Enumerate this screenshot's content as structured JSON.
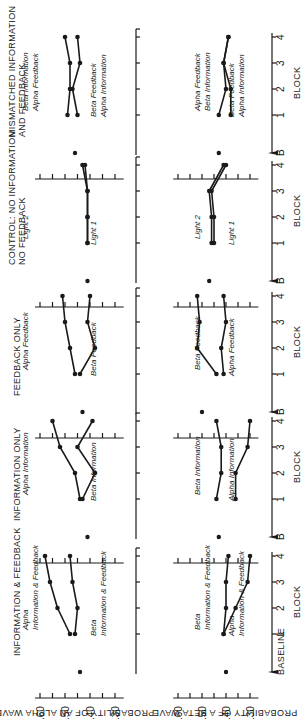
{
  "chart_data": {
    "type": "line",
    "orientation": "figure rotated 90° counterclockwise",
    "ylabel_alpha": "PROBABILITY OF AN ALPHA WAVE",
    "ylabel_beta": "PROBABILITY OF A BETA WAVE",
    "xlabel": "BLOCK",
    "x_ticks": [
      "B",
      "1",
      "2",
      "3",
      "4"
    ],
    "x_first_label": "BASELINE",
    "y_ticks": [
      ".60",
      ".50",
      ".40",
      ".30"
    ],
    "ylim": [
      0.25,
      0.62
    ],
    "panels": [
      {
        "title": "INFORMATION & FEEDBACK",
        "alpha": {
          "baseline": 0.44,
          "series": [
            {
              "name": "Alpha Information & Feedback",
              "values": [
                0.48,
                0.53,
                0.56,
                0.58
              ]
            },
            {
              "name": "Beta Information & Feedback",
              "values": [
                0.46,
                0.45,
                0.47,
                0.48
              ]
            }
          ]
        },
        "beta": {
          "baseline": 0.4,
          "series": [
            {
              "name": "Beta Information & Feedback",
              "values": [
                0.41,
                0.4,
                0.4,
                0.39
              ]
            },
            {
              "name": "Alpha Information & Feedback",
              "values": [
                0.41,
                0.36,
                0.31,
                0.3
              ]
            }
          ]
        }
      },
      {
        "title": "INFORMATION ONLY",
        "alpha": {
          "baseline": 0.41,
          "series": [
            {
              "name": "Alpha Information",
              "values": [
                0.44,
                0.46,
                0.52,
                0.55
              ]
            },
            {
              "name": "Beta Information",
              "values": [
                0.43,
                0.38,
                0.45,
                0.39
              ]
            }
          ]
        },
        "beta": {
          "baseline": 0.43,
          "series": [
            {
              "name": "Beta Information",
              "values": [
                0.44,
                0.42,
                0.42,
                0.44
              ]
            },
            {
              "name": "Alpha Information",
              "values": [
                0.36,
                0.36,
                0.31,
                0.3
              ]
            }
          ]
        }
      },
      {
        "title": "FEEDBACK ONLY",
        "alpha": {
          "baseline": 0.43,
          "series": [
            {
              "name": "Alpha Feedback",
              "values": [
                0.46,
                0.48,
                0.5,
                0.51
              ]
            },
            {
              "name": "Beta Feedback",
              "values": [
                0.44,
                0.38,
                0.41,
                0.4
              ]
            }
          ]
        },
        "beta": {
          "baseline": 0.5,
          "series": [
            {
              "name": "Beta Feedback",
              "values": [
                0.44,
                0.52,
                0.51,
                0.52
              ]
            },
            {
              "name": "Alpha Feedback",
              "values": [
                0.41,
                0.42,
                0.4,
                0.41
              ]
            }
          ]
        }
      },
      {
        "title": "CONTROL: NO INFORMATION NO FEEDBACK",
        "alpha": {
          "baseline": 0.41,
          "series": [
            {
              "name": "Light 2",
              "values": [
                0.41,
                0.41,
                0.41,
                0.43
              ]
            },
            {
              "name": "Light 1",
              "values": [
                0.41,
                0.41,
                0.41,
                0.42
              ]
            }
          ]
        },
        "beta": {
          "baseline": 0.47,
          "series": [
            {
              "name": "Light 2",
              "values": [
                0.46,
                0.46,
                0.47,
                0.41
              ]
            },
            {
              "name": "Light 1",
              "values": [
                0.45,
                0.45,
                0.46,
                0.4
              ]
            }
          ]
        }
      },
      {
        "title": "MISMATCHED INFORMATION AND FEEDBACK",
        "alpha": {
          "baseline": 0.46,
          "series": [
            {
              "name": "Beta Information / Alpha Feedback",
              "values": [
                0.49,
                0.48,
                0.48,
                0.5
              ]
            },
            {
              "name": "Beta Feedback / Alpha Information",
              "values": [
                0.45,
                0.47,
                0.44,
                0.45
              ]
            }
          ]
        },
        "beta": {
          "baseline": 0.43,
          "series": [
            {
              "name": "Alpha Feedback / Beta Information",
              "values": [
                0.43,
                0.4,
                0.41,
                0.39
              ]
            },
            {
              "name": "Beta Feedback / Alpha Information",
              "values": [
                0.38,
                0.38,
                0.41,
                0.39
              ]
            }
          ]
        }
      }
    ]
  },
  "labels": {
    "panel_titles": [
      [
        "INFORMATION & FEEDBACK"
      ],
      [
        "INFORMATION ONLY"
      ],
      [
        "FEEDBACK ONLY"
      ],
      [
        "CONTROL: NO INFORMATION",
        "NO FEEDBACK"
      ],
      [
        "MISMATCHED INFORMATION",
        "AND FEEDBACK"
      ]
    ],
    "alpha_series_labels": [
      [
        [
          "Alpha",
          "Information & Feedback"
        ],
        [
          "Beta",
          "Information & Feedback"
        ]
      ],
      [
        [
          "Alpha Information"
        ],
        [
          "Beta Information"
        ]
      ],
      [
        [
          "Alpha Feedback"
        ],
        [
          "Beta Feedback"
        ]
      ],
      [
        [
          "Light 2"
        ],
        [
          "Light 1"
        ]
      ],
      [
        [
          "Beta Information",
          "Alpha Feedback"
        ],
        [
          "Beta Feedback",
          "Alpha Information"
        ]
      ]
    ],
    "beta_series_labels": [
      [
        [
          "Beta",
          "Information & Feedback"
        ],
        [
          "Alpha",
          "Information & Feedback"
        ]
      ],
      [
        [
          "Beta Information"
        ],
        [
          "Alpha Information"
        ]
      ],
      [
        [
          "Beta Feedback"
        ],
        [
          "Alpha Feedback"
        ]
      ],
      [
        [
          "Light 2"
        ],
        [
          "Light 1"
        ]
      ],
      [
        [
          "Alpha Feedback",
          "Beta Information"
        ],
        [
          "Beta Feedback",
          "Alpha Information"
        ]
      ]
    ]
  }
}
